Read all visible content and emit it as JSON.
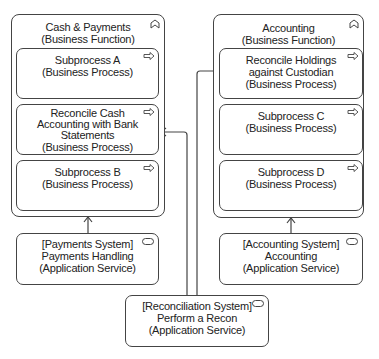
{
  "functions": [
    {
      "title": "Cash & Payments",
      "type": "(Business Function)",
      "processes": [
        {
          "lines": [
            "Subprocess A",
            "(Business Process)"
          ]
        },
        {
          "lines": [
            "Reconcile Cash",
            "Accounting with Bank",
            "Statements",
            "(Business Process)"
          ]
        },
        {
          "lines": [
            "Subprocess B",
            "(Business Process)"
          ]
        }
      ]
    },
    {
      "title": "Accounting",
      "type": "(Business Function)",
      "processes": [
        {
          "lines": [
            "Reconcile Holdings",
            "against Custodian",
            "(Business Process)"
          ]
        },
        {
          "lines": [
            "Subprocess C",
            "(Business Process)"
          ]
        },
        {
          "lines": [
            "Subprocess D",
            "(Business Process)"
          ]
        }
      ]
    }
  ],
  "services": [
    {
      "lines": [
        "[Payments System]",
        "Payments Handling",
        "(Application Service)"
      ]
    },
    {
      "lines": [
        "[Accounting System]",
        "Accounting",
        "(Application Service)"
      ]
    },
    {
      "lines": [
        "[Reconciliation System]",
        "Perform a Recon",
        "(Application Service)"
      ]
    }
  ],
  "icons": {
    "function": "business-function-icon",
    "process": "business-process-arrow-icon",
    "service": "application-service-icon"
  },
  "colors": {
    "stroke": "#444444",
    "fill": "#ffffff",
    "text": "#222222"
  }
}
